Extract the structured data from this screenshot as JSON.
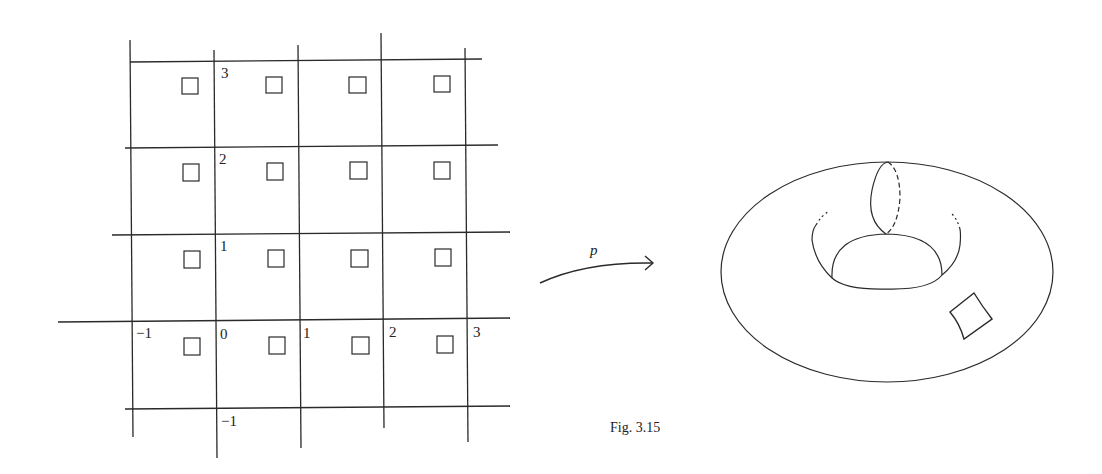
{
  "figure": {
    "caption": "Fig. 3.15",
    "map_label": "p",
    "stroke_color": "#2a2a2a",
    "background": "#ffffff"
  },
  "lattice": {
    "description": "Integer lattice grid of the plane (R^2) with a small square in each unit cell",
    "x_axis_labels": [
      "−1",
      "0",
      "1",
      "2",
      "3"
    ],
    "y_axis_labels": [
      "3",
      "2",
      "1",
      "0",
      "−1"
    ],
    "labels": {
      "y3": "3",
      "y2": "2",
      "y1": "1",
      "x_neg1": "−1",
      "origin": "0",
      "x1": "1",
      "x2": "2",
      "x3": "3",
      "y_neg1": "−1"
    },
    "rows": 4,
    "cols": 4,
    "square_count": 16
  },
  "torus": {
    "description": "Torus with a meridian circle (solid front, dashed back) and a small curved square patch image"
  }
}
